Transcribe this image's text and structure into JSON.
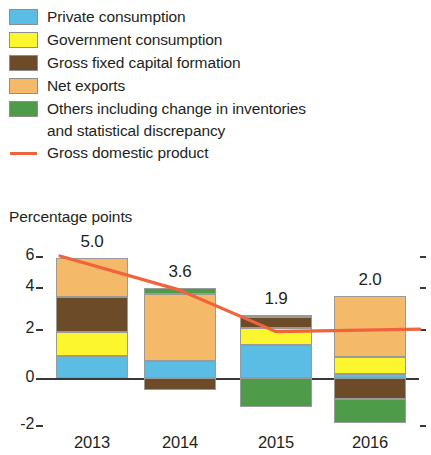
{
  "legend": {
    "items": [
      {
        "label": "Private consumption",
        "color": "#5bbce4",
        "key": "swatch"
      },
      {
        "label": "Government consumption",
        "color": "#fcf62e",
        "key": "swatch"
      },
      {
        "label": "Gross fixed capital formation",
        "color": "#6b4b28",
        "key": "swatch"
      },
      {
        "label": "Net exports",
        "color": "#f5b96a",
        "key": "swatch"
      },
      {
        "label": "Others including change in inventories",
        "color": "#4e9b4a",
        "key": "swatch"
      }
    ],
    "continuation_line": "and statistical discrepancy",
    "line_item": {
      "label": "Gross domestic product",
      "color": "#f0643c",
      "key": "line"
    }
  },
  "chart_data": {
    "type": "bar",
    "stacked": true,
    "title": "",
    "ylabel": "Percentage points",
    "xlabel": "",
    "categories": [
      "2013",
      "2014",
      "2015",
      "2016"
    ],
    "ylim": [
      -2,
      6
    ],
    "yticks": [
      6,
      4,
      2,
      0,
      -2
    ],
    "ytick_labels": [
      "6",
      "4",
      "2",
      "0",
      "-2"
    ],
    "grid": false,
    "legend_position": "above-plot",
    "series": [
      {
        "name": "Private consumption",
        "color": "#5bbce4",
        "values": [
          0.9,
          0.7,
          1.35,
          0.15
        ]
      },
      {
        "name": "Government consumption",
        "color": "#fcf62e",
        "values": [
          1.0,
          0.0,
          0.7,
          0.7
        ]
      },
      {
        "name": "Gross fixed capital formation",
        "color": "#6b4b28",
        "values": [
          1.4,
          -0.5,
          0.45,
          -0.85
        ]
      },
      {
        "name": "Net exports",
        "color": "#f5b96a",
        "values": [
          1.6,
          2.75,
          0.1,
          2.5
        ]
      },
      {
        "name": "Others including change in inventories and statistical discrepancy",
        "color": "#4e9b4a",
        "values": [
          0.0,
          0.25,
          -1.2,
          -1.0
        ]
      }
    ],
    "line_series": {
      "name": "Gross domestic product",
      "color": "#f0643c",
      "values": [
        5.0,
        3.6,
        1.9,
        2.0
      ],
      "data_labels": [
        "5.0",
        "3.6",
        "1.9",
        "2.0"
      ]
    }
  }
}
